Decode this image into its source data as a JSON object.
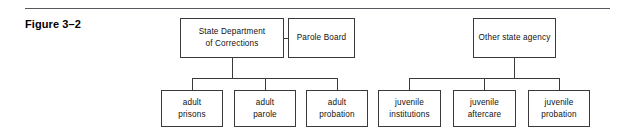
{
  "figure": {
    "label": "Figure 3–2"
  },
  "diagram": {
    "type": "org-chart",
    "nodes": {
      "state_dept_corrections": "State Department\nof Corrections",
      "parole_board": "Parole Board",
      "other_state_agency": "Other state agency",
      "adult_prisons": "adult\nprisons",
      "adult_parole": "adult\nparole",
      "adult_probation": "adult\nprobation",
      "juvenile_institutions": "juvenile\ninstitutions",
      "juvenile_aftercare": "juvenile\naftercare",
      "juvenile_probation": "juvenile\nprobation"
    },
    "edges": [
      {
        "from": "state_dept_corrections",
        "to": "parole_board",
        "style": "horizontal-link"
      },
      {
        "from": "state_dept_corrections",
        "to": "adult_prisons",
        "style": "bus"
      },
      {
        "from": "state_dept_corrections",
        "to": "adult_parole",
        "style": "bus"
      },
      {
        "from": "state_dept_corrections",
        "to": "adult_probation",
        "style": "bus"
      },
      {
        "from": "other_state_agency",
        "to": "juvenile_institutions",
        "style": "bus"
      },
      {
        "from": "other_state_agency",
        "to": "juvenile_aftercare",
        "style": "bus"
      },
      {
        "from": "other_state_agency",
        "to": "juvenile_probation",
        "style": "bus"
      }
    ]
  },
  "colors": {
    "rule": "#55585c",
    "box_border": "#3a3a3a",
    "text": "#111111",
    "background": "#ffffff"
  }
}
